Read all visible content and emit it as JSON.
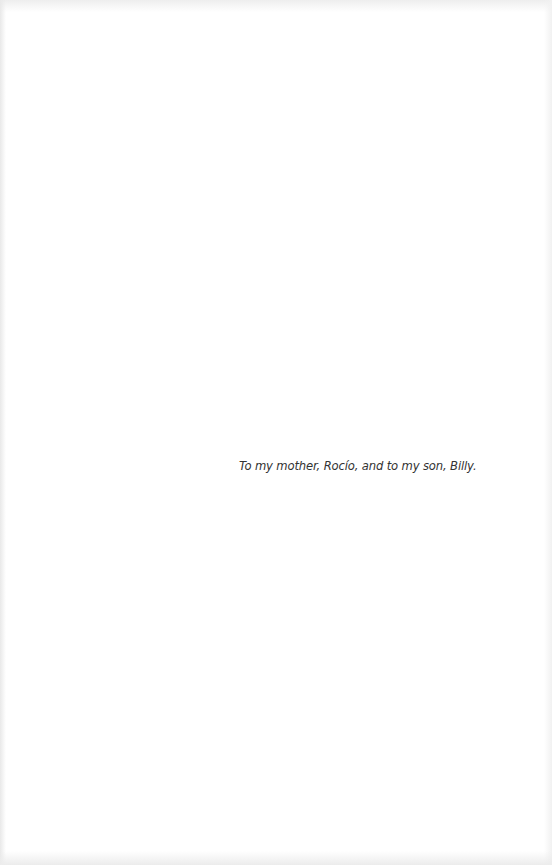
{
  "page": {
    "type": "dedication",
    "dedication_text": "To my mother, Rocío, and to my son, Billy.",
    "colors": {
      "background": "#ffffff",
      "text": "#333333"
    }
  }
}
